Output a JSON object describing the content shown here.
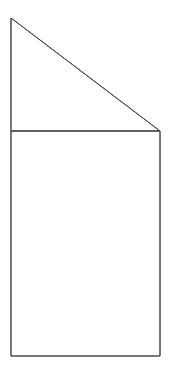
{
  "canvas": {
    "width": 182,
    "height": 373,
    "background_color": "#ffffff"
  },
  "figure": {
    "type": "line-drawing",
    "stroke_color": "#4a4a4a",
    "stroke_width": 1,
    "fill_color": "none",
    "vertices": {
      "apex": [
        11,
        18
      ],
      "triangle_right": [
        160,
        131
      ],
      "divider_left": [
        11,
        131
      ],
      "bottom_left": [
        11,
        356
      ],
      "bottom_right": [
        160,
        356
      ]
    },
    "parts": [
      {
        "name": "triangle",
        "shape": "polygon",
        "points": "11,18 160,131 11,131",
        "description": "Right triangle with vertical left leg and horizontal bottom leg"
      },
      {
        "name": "rectangle",
        "shape": "polygon",
        "points": "11,131 160,131 160,356 11,356",
        "description": "Rectangle below the triangle sharing the horizontal divider edge"
      }
    ],
    "segments": [
      {
        "name": "left-edge",
        "x1": 11,
        "y1": 18,
        "x2": 11,
        "y2": 356
      },
      {
        "name": "diagonal-hypotenuse",
        "x1": 11,
        "y1": 18,
        "x2": 160,
        "y2": 131
      },
      {
        "name": "horizontal-divider",
        "x1": 11,
        "y1": 131,
        "x2": 160,
        "y2": 131
      },
      {
        "name": "right-edge",
        "x1": 160,
        "y1": 131,
        "x2": 160,
        "y2": 356
      },
      {
        "name": "bottom-edge",
        "x1": 11,
        "y1": 356,
        "x2": 160,
        "y2": 356
      }
    ]
  }
}
